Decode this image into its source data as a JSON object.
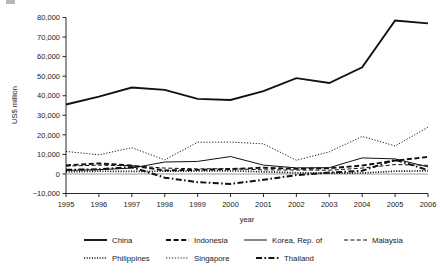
{
  "chart_data": {
    "type": "line",
    "title": "",
    "xlabel": "year",
    "ylabel": "US$ million",
    "x": [
      1995,
      1996,
      1997,
      1998,
      1999,
      2000,
      2001,
      2002,
      2003,
      2004,
      2005,
      2006
    ],
    "categories": [
      "1995",
      "1996",
      "1997",
      "1998",
      "1999",
      "2000",
      "2001",
      "2002",
      "2003",
      "2004",
      "2005",
      "2006"
    ],
    "xlim": [
      1995,
      2006
    ],
    "ylim": [
      -10000,
      80000
    ],
    "ytick_values": [
      80000,
      70000,
      60000,
      50000,
      40000,
      30000,
      20000,
      10000,
      0,
      -10000
    ],
    "ytick_labels": [
      "80,000",
      "70,000",
      "60,000",
      "50,000",
      "40,000",
      "30,000",
      "20,000",
      "10,000",
      "0",
      "−10,000"
    ],
    "grid": false,
    "legend_position": "bottom",
    "zero_reference_line": true,
    "series": [
      {
        "name": "China",
        "style": "solid-thick",
        "values": [
          35500,
          39500,
          44200,
          43000,
          38400,
          37800,
          42300,
          49000,
          46500,
          54500,
          78500,
          77000
        ]
      },
      {
        "name": "Indonesia",
        "style": "dashed-thick",
        "values": [
          4400,
          5400,
          4300,
          1800,
          2100,
          2500,
          3200,
          2600,
          2900,
          4300,
          6800,
          8700
        ]
      },
      {
        "name": "Korea, Rep. of",
        "style": "solid-thin",
        "values": [
          1800,
          2200,
          3000,
          6100,
          6400,
          8900,
          4500,
          3100,
          3200,
          8200,
          7700,
          3600
        ]
      },
      {
        "name": "Malaysia",
        "style": "dashed-thin",
        "values": [
          4000,
          4500,
          4200,
          3000,
          2600,
          2700,
          2100,
          2000,
          1900,
          3000,
          4800,
          4400
        ]
      },
      {
        "name": "Philippines",
        "style": "dotted-thick",
        "values": [
          1100,
          1400,
          1300,
          1400,
          1500,
          1600,
          1100,
          600,
          400,
          500,
          1400,
          1600
        ]
      },
      {
        "name": "Singapore",
        "style": "dotted-thin",
        "values": [
          11500,
          9800,
          13400,
          7200,
          16200,
          16300,
          15400,
          7000,
          11300,
          19200,
          14300,
          23900
        ]
      },
      {
        "name": "Thailand",
        "style": "dashdot-thick",
        "values": [
          2100,
          2400,
          3500,
          -1900,
          -4200,
          -5100,
          -3000,
          -600,
          700,
          1600,
          7300,
          1900
        ]
      }
    ]
  },
  "legend": {
    "rows": [
      [
        {
          "label": "China",
          "style": "solid-thick"
        },
        {
          "label": "Indonesia",
          "style": "dashed-thick"
        },
        {
          "label": "Korea, Rep. of",
          "style": "solid-thin"
        },
        {
          "label": "Malaysia",
          "style": "dashed-thin"
        }
      ],
      [
        {
          "label": "Philippines",
          "style": "dotted-thick"
        },
        {
          "label": "Singapore",
          "style": "dotted-thin"
        },
        {
          "label": "Thailand",
          "style": "dashdot-thick"
        }
      ]
    ]
  },
  "colors": {
    "ink": "#111111",
    "zero_line": "#9a9a9a",
    "background": "#ffffff"
  }
}
